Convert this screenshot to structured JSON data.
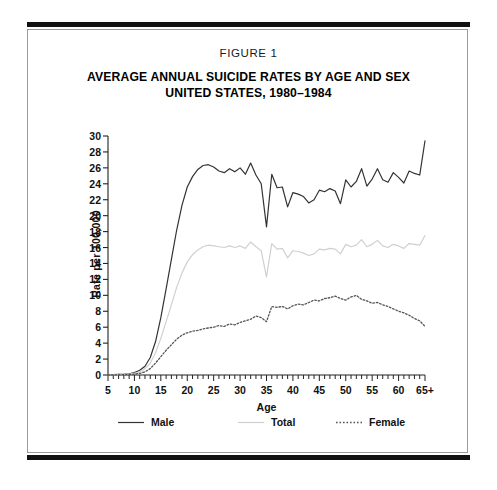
{
  "figure": {
    "label": "FIGURE 1",
    "title_line1": "AVERAGE ANNUAL SUICIDE RATES BY AGE AND SEX",
    "title_line2": "UNITED STATES, 1980–1984"
  },
  "colors": {
    "male": "#333333",
    "total": "#d0d0d0",
    "female": "#555555",
    "axis": "#222222",
    "frame": "#9a9a9a",
    "rule": "#111111"
  },
  "chart_data": {
    "type": "line",
    "title": "AVERAGE ANNUAL SUICIDE RATES BY AGE AND SEX UNITED STATES, 1980–1984",
    "xlabel": "Age",
    "ylabel": "Rate per 100,000",
    "xlim": [
      5,
      65
    ],
    "ylim": [
      0,
      30
    ],
    "ytick_step": 2,
    "xtick_step": 5,
    "grid": false,
    "legend_position": "below-axis",
    "minor_xticks": "every 1 year",
    "xtick_labels": [
      "5",
      "10",
      "15",
      "20",
      "25",
      "30",
      "35",
      "40",
      "45",
      "50",
      "55",
      "60",
      "65+"
    ],
    "ytick_labels": [
      "0",
      "2",
      "4",
      "6",
      "8",
      "10",
      "12",
      "14",
      "16",
      "18",
      "20",
      "22",
      "24",
      "26",
      "28",
      "30"
    ],
    "x": [
      5,
      6,
      7,
      8,
      9,
      10,
      11,
      12,
      13,
      14,
      15,
      16,
      17,
      18,
      19,
      20,
      21,
      22,
      23,
      24,
      25,
      26,
      27,
      28,
      29,
      30,
      31,
      32,
      33,
      34,
      35,
      36,
      37,
      38,
      39,
      40,
      41,
      42,
      43,
      44,
      45,
      46,
      47,
      48,
      49,
      50,
      51,
      52,
      53,
      54,
      55,
      56,
      57,
      58,
      59,
      60,
      61,
      62,
      63,
      64,
      65
    ],
    "series": [
      {
        "name": "Male",
        "style": "solid",
        "color": "#333333",
        "values": [
          0.05,
          0.05,
          0.08,
          0.1,
          0.15,
          0.3,
          0.6,
          1.1,
          2.2,
          4.2,
          7.2,
          10.8,
          14.5,
          18.2,
          21.3,
          23.6,
          24.9,
          25.8,
          26.3,
          26.4,
          26.1,
          25.6,
          25.4,
          25.9,
          25.5,
          26.0,
          25.2,
          26.6,
          25.1,
          24.0,
          18.6,
          25.2,
          23.5,
          23.6,
          21.1,
          22.9,
          22.7,
          22.4,
          21.6,
          22.0,
          23.2,
          23.0,
          23.4,
          23.1,
          21.5,
          24.5,
          23.6,
          24.3,
          25.9,
          23.7,
          24.6,
          25.9,
          24.5,
          24.2,
          25.4,
          24.8,
          24.1,
          25.6,
          25.3,
          25.1,
          29.4
        ]
      },
      {
        "name": "Total",
        "style": "solid",
        "color": "#d0d0d0",
        "values": [
          0.03,
          0.03,
          0.05,
          0.07,
          0.1,
          0.2,
          0.4,
          0.8,
          1.5,
          2.8,
          4.6,
          6.7,
          8.8,
          11.0,
          12.8,
          14.2,
          15.1,
          15.7,
          16.1,
          16.3,
          16.2,
          16.1,
          16.0,
          16.2,
          16.0,
          16.2,
          15.9,
          16.7,
          16.1,
          15.6,
          12.3,
          16.5,
          15.8,
          15.9,
          14.7,
          15.6,
          15.5,
          15.3,
          15.0,
          15.2,
          15.8,
          15.7,
          15.9,
          15.8,
          15.2,
          16.4,
          16.1,
          16.3,
          17.0,
          16.1,
          16.4,
          16.9,
          16.2,
          16.0,
          16.4,
          16.2,
          15.9,
          16.5,
          16.4,
          16.3,
          17.5
        ]
      },
      {
        "name": "Female",
        "style": "dotted",
        "color": "#555555",
        "values": [
          0.02,
          0.02,
          0.03,
          0.04,
          0.06,
          0.1,
          0.2,
          0.4,
          0.8,
          1.5,
          2.3,
          3.1,
          3.8,
          4.5,
          5.0,
          5.3,
          5.5,
          5.6,
          5.8,
          5.9,
          6.0,
          6.2,
          6.1,
          6.4,
          6.3,
          6.6,
          6.8,
          7.0,
          7.4,
          7.2,
          6.7,
          8.6,
          8.5,
          8.6,
          8.3,
          8.7,
          8.9,
          8.8,
          9.1,
          9.4,
          9.3,
          9.6,
          9.7,
          9.9,
          9.6,
          9.4,
          9.8,
          10.0,
          9.5,
          9.3,
          9.0,
          9.1,
          8.8,
          8.6,
          8.3,
          8.0,
          7.8,
          7.5,
          7.1,
          6.8,
          6.1
        ]
      }
    ]
  },
  "legend": [
    {
      "label": "Male",
      "style": "solid",
      "color": "#333333"
    },
    {
      "label": "Total",
      "style": "solid",
      "color": "#d0d0d0"
    },
    {
      "label": "Female",
      "style": "dotted",
      "color": "#555555"
    }
  ]
}
